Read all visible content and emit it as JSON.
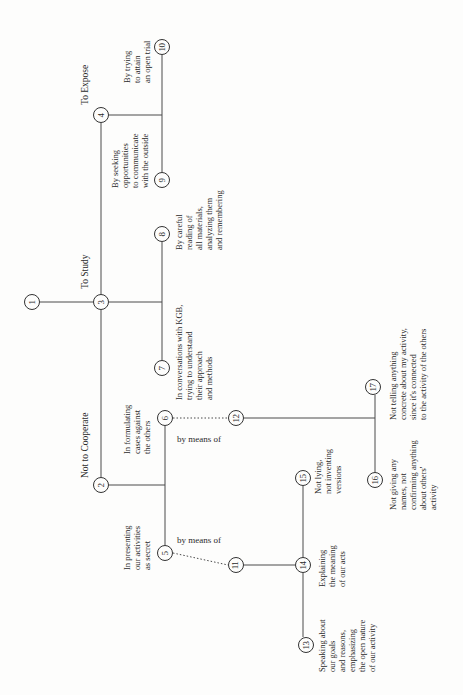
{
  "diagram": {
    "nodes": [
      {
        "id": "1",
        "label": "1"
      },
      {
        "id": "2",
        "label": "2"
      },
      {
        "id": "3",
        "label": "3"
      },
      {
        "id": "4",
        "label": "4"
      },
      {
        "id": "5",
        "label": "5"
      },
      {
        "id": "6",
        "label": "6"
      },
      {
        "id": "7",
        "label": "7"
      },
      {
        "id": "8",
        "label": "8"
      },
      {
        "id": "9",
        "label": "9"
      },
      {
        "id": "10",
        "label": "10"
      },
      {
        "id": "11",
        "label": "11"
      },
      {
        "id": "12",
        "label": "12"
      },
      {
        "id": "13",
        "label": "13"
      },
      {
        "id": "14",
        "label": "14"
      },
      {
        "id": "15",
        "label": "15"
      },
      {
        "id": "16",
        "label": "16"
      },
      {
        "id": "17",
        "label": "17"
      }
    ],
    "branch_labels": {
      "n2": "Not to Cooperate",
      "n3": "To Study",
      "n4": "To Expose"
    },
    "texts": {
      "n5": "In presenting\nour activities\nas secret",
      "n6": "In formulating\ncases against\nthe others",
      "n7": "In conversations with KGB,\ntrying to understand\ntheir approach\nand methods",
      "n8": "By careful\nreading of\nall materials,\nanalyzing them\nand remembering",
      "n9": "By seeking\nopportunities\nto communicate\nwith the outside",
      "n10": "By trying\nto attain\nan open trial",
      "n13": "Speaking about\nour goals\nand reasons,\nemphasizing\nthe open nature\nof our activity",
      "n14": "Explaining\nthe meaning\nof our acts",
      "n15": "Not lying,\nnot inventing\nversions",
      "n16": "Not giving any\nnames, not\nconfirming anything\nabout others'\nactivity",
      "n17": "Not telling anything\nconcrete about my activity,\nsince it's connected\nto the activity of the others"
    },
    "connector_labels": {
      "n5_n11": "by means of",
      "n6_n12": "by means of"
    },
    "edges": [
      {
        "from": "1",
        "to": "3"
      },
      {
        "from": "3",
        "to": "2"
      },
      {
        "from": "3",
        "to": "4"
      },
      {
        "from": "3",
        "to": "7"
      },
      {
        "from": "3",
        "to": "8"
      },
      {
        "from": "4",
        "to": "9"
      },
      {
        "from": "4",
        "to": "10"
      },
      {
        "from": "2",
        "to": "5"
      },
      {
        "from": "2",
        "to": "6"
      },
      {
        "from": "5",
        "to": "11",
        "style": "dotted"
      },
      {
        "from": "6",
        "to": "12",
        "style": "dotted"
      },
      {
        "from": "11",
        "to": "14"
      },
      {
        "from": "14",
        "to": "13"
      },
      {
        "from": "14",
        "to": "15"
      },
      {
        "from": "12",
        "to": "16"
      },
      {
        "from": "12",
        "to": "17"
      }
    ],
    "colors": {
      "line": "#4a4a4a",
      "text": "#2a2a2a",
      "background": "#fdfdfc"
    }
  }
}
